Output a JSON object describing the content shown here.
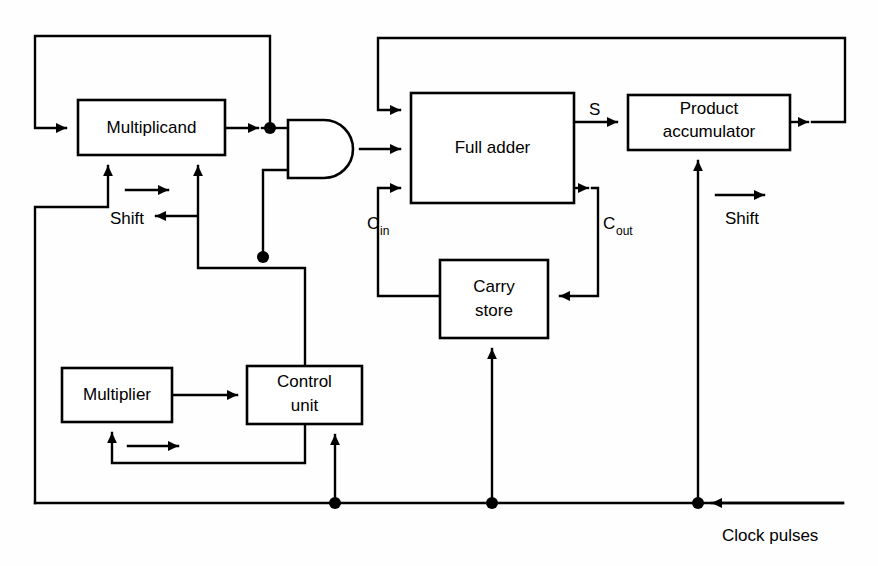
{
  "diagram": {
    "type": "block-diagram",
    "blocks": [
      {
        "id": "multiplicand",
        "label": "Multiplicand",
        "label_line1": "Multiplicand",
        "label_line2": "",
        "x": 78,
        "y": 100,
        "w": 147,
        "h": 55
      },
      {
        "id": "full-adder",
        "label": "Full adder",
        "label_line1": "Full adder",
        "label_line2": "",
        "x": 411,
        "y": 93,
        "w": 163,
        "h": 110
      },
      {
        "id": "product-accumulator",
        "label": "Product accumulator",
        "label_line1": "Product",
        "label_line2": "accumulator",
        "x": 628,
        "y": 95,
        "w": 162,
        "h": 55
      },
      {
        "id": "carry-store",
        "label": "Carry store",
        "label_line1": "Carry",
        "label_line2": "store",
        "x": 440,
        "y": 260,
        "w": 108,
        "h": 78
      },
      {
        "id": "multiplier",
        "label": "Multiplier",
        "label_line1": "Multiplier",
        "label_line2": "",
        "x": 62,
        "y": 368,
        "w": 110,
        "h": 54
      },
      {
        "id": "control-unit",
        "label": "Control unit",
        "label_line1": "Control",
        "label_line2": "unit",
        "x": 247,
        "y": 366,
        "w": 115,
        "h": 58
      }
    ],
    "gates": [
      {
        "id": "and-gate",
        "type": "AND",
        "x": 288,
        "y": 120,
        "w": 72,
        "h": 58
      }
    ],
    "signals": [
      {
        "id": "sum-out",
        "label": "S",
        "x": 589,
        "y": 108
      },
      {
        "id": "carry-in",
        "label": "C",
        "sub": "in",
        "x": 367,
        "y": 222
      },
      {
        "id": "carry-out",
        "label": "C",
        "sub": "out",
        "x": 603,
        "y": 222
      },
      {
        "id": "shift-left",
        "label": "Shift",
        "x": 110,
        "y": 220
      },
      {
        "id": "shift-right",
        "label": "Shift",
        "x": 725,
        "y": 220
      },
      {
        "id": "clock",
        "label": "Clock pulses",
        "x": 722,
        "y": 535
      }
    ],
    "junctions": [
      {
        "id": "multiplicand-out-tap",
        "x": 270,
        "y": 128
      },
      {
        "id": "and-lower-input-tap",
        "x": 263,
        "y": 257
      },
      {
        "id": "clock-tap-control",
        "x": 335,
        "y": 503
      },
      {
        "id": "clock-tap-carry",
        "x": 492,
        "y": 503
      },
      {
        "id": "clock-tap-product",
        "x": 698,
        "y": 503
      }
    ],
    "colors": {
      "line": "#000000",
      "background": "#ffffff",
      "text": "#000000"
    }
  }
}
